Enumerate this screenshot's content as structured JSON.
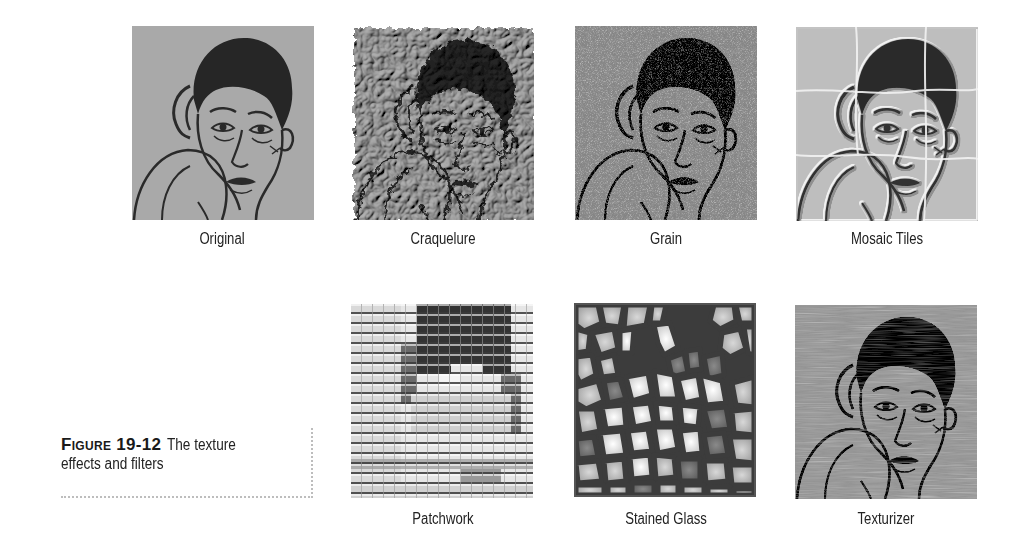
{
  "figure": {
    "number": "Figure 19-12",
    "title_line1": "The texture",
    "title_line2": "effects and filters"
  },
  "panels": [
    {
      "id": "original",
      "label": "Original",
      "effect": "none"
    },
    {
      "id": "craquelure",
      "label": "Craquelure",
      "effect": "craquelure"
    },
    {
      "id": "grain",
      "label": "Grain",
      "effect": "grain"
    },
    {
      "id": "mosaic-tiles",
      "label": "Mosaic Tiles",
      "effect": "mosaic-tiles"
    },
    {
      "id": "patchwork",
      "label": "Patchwork",
      "effect": "patchwork"
    },
    {
      "id": "stained-glass",
      "label": "Stained Glass",
      "effect": "stained-glass"
    },
    {
      "id": "texturizer",
      "label": "Texturizer",
      "effect": "texturizer"
    }
  ],
  "colors": {
    "background": "#ffffff",
    "image_gray": "#a9a9a9",
    "ink": "#2a2a2a",
    "caption_border": "#bdbdbd"
  }
}
